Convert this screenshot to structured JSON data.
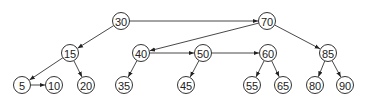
{
  "diagram": {
    "type": "tree-with-links",
    "nodes": [
      {
        "id": "n30",
        "label": "30",
        "x": 121,
        "y": 21
      },
      {
        "id": "n70",
        "label": "70",
        "x": 267,
        "y": 21
      },
      {
        "id": "n15",
        "label": "15",
        "x": 70,
        "y": 53
      },
      {
        "id": "n40",
        "label": "40",
        "x": 141,
        "y": 53
      },
      {
        "id": "n50",
        "label": "50",
        "x": 203,
        "y": 53
      },
      {
        "id": "n60",
        "label": "60",
        "x": 268,
        "y": 53
      },
      {
        "id": "n85",
        "label": "85",
        "x": 328,
        "y": 53
      },
      {
        "id": "n5",
        "label": "5",
        "x": 22,
        "y": 85
      },
      {
        "id": "n10",
        "label": "10",
        "x": 54,
        "y": 85
      },
      {
        "id": "n20",
        "label": "20",
        "x": 86,
        "y": 85
      },
      {
        "id": "n35",
        "label": "35",
        "x": 124,
        "y": 85
      },
      {
        "id": "n45",
        "label": "45",
        "x": 186,
        "y": 85
      },
      {
        "id": "n55",
        "label": "55",
        "x": 252,
        "y": 85
      },
      {
        "id": "n65",
        "label": "65",
        "x": 283,
        "y": 85
      },
      {
        "id": "n80",
        "label": "80",
        "x": 315,
        "y": 85
      },
      {
        "id": "n90",
        "label": "90",
        "x": 345,
        "y": 85
      }
    ],
    "edges": [
      {
        "from": "n30",
        "to": "n70"
      },
      {
        "from": "n30",
        "to": "n15"
      },
      {
        "from": "n70",
        "to": "n40"
      },
      {
        "from": "n70",
        "to": "n85"
      },
      {
        "from": "n40",
        "to": "n50"
      },
      {
        "from": "n50",
        "to": "n60"
      },
      {
        "from": "n15",
        "to": "n5"
      },
      {
        "from": "n15",
        "to": "n20"
      },
      {
        "from": "n5",
        "to": "n10"
      },
      {
        "from": "n40",
        "to": "n35"
      },
      {
        "from": "n50",
        "to": "n45"
      },
      {
        "from": "n60",
        "to": "n55"
      },
      {
        "from": "n60",
        "to": "n65"
      },
      {
        "from": "n85",
        "to": "n80"
      },
      {
        "from": "n85",
        "to": "n90"
      }
    ]
  }
}
